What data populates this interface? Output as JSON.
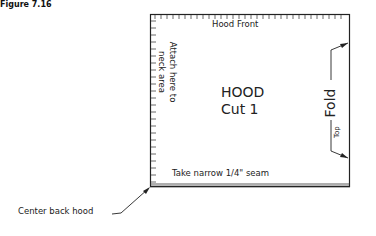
{
  "figure": {
    "label": "Figure 7.16",
    "pattern": {
      "top_edge_label": "Hood Front",
      "left_edge_label_line1": "Attach here to",
      "left_edge_label_line2": "neck area",
      "title_line1": "HOOD",
      "title_line2": "Cut 1",
      "fold_label": "Fold",
      "top_label": "Top",
      "bottom_edge_label": "Take narrow 1/4\" seam"
    },
    "callout": {
      "label": "Center back hood"
    },
    "colors": {
      "line": "#222222",
      "background": "#ffffff"
    }
  }
}
